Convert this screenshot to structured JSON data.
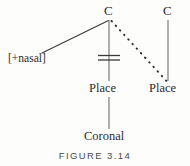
{
  "figure": {
    "caption": "FIGURE 3.14",
    "colors": {
      "background": "#fdfdfb",
      "ink": "#2b2b2b",
      "caption_ink": "#4a4a4a"
    }
  },
  "diagram": {
    "type": "autosegmental-feature-geometry-tree",
    "nodes": [
      {
        "id": "c-left",
        "label": "C",
        "x": 109,
        "y": 12
      },
      {
        "id": "c-right",
        "label": "C",
        "x": 168,
        "y": 12
      },
      {
        "id": "feature-nasal",
        "label": "[+nasal]",
        "x": 30,
        "y": 59
      },
      {
        "id": "place-left",
        "label": "Place",
        "x": 109,
        "y": 89
      },
      {
        "id": "place-right",
        "label": "Place",
        "x": 168,
        "y": 89
      },
      {
        "id": "coronal",
        "label": "Coronal",
        "x": 109,
        "y": 137
      }
    ],
    "edges": [
      {
        "id": "edge-nasal-to-c-left",
        "from": "feature-nasal",
        "to": "c-left",
        "style": "solid"
      },
      {
        "id": "edge-c-left-to-place",
        "from": "c-left",
        "to": "place-left",
        "style": "solid",
        "delinked": true
      },
      {
        "id": "edge-c-left-to-place-right",
        "from": "c-left",
        "to": "place-right",
        "style": "dotted"
      },
      {
        "id": "edge-c-right-to-place",
        "from": "c-right",
        "to": "place-right",
        "style": "solid"
      },
      {
        "id": "edge-place-to-coronal",
        "from": "place-left",
        "to": "coronal",
        "style": "solid"
      }
    ],
    "delink_mark": {
      "id": "delink-double-bar",
      "symbol": "=",
      "x": 109,
      "y": 58,
      "half_width": 11,
      "gap": 4
    }
  }
}
